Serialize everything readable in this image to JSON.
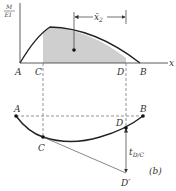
{
  "diagram": {
    "top": {
      "y_axis_label_num": "M",
      "y_axis_label_den": "EI",
      "x_axis_label": "x",
      "points": [
        "A",
        "C",
        "D",
        "B"
      ],
      "dimension_label": "x̄",
      "dimension_subscript": "2"
    },
    "bottom": {
      "points": [
        "A",
        "B",
        "C",
        "D",
        "D′"
      ],
      "deviation_label": "t",
      "deviation_subscript": "D/C",
      "figure_label": "(b)"
    },
    "colors": {
      "line": "#222222",
      "shade": "#cccccc",
      "dashed": "#666666"
    }
  }
}
